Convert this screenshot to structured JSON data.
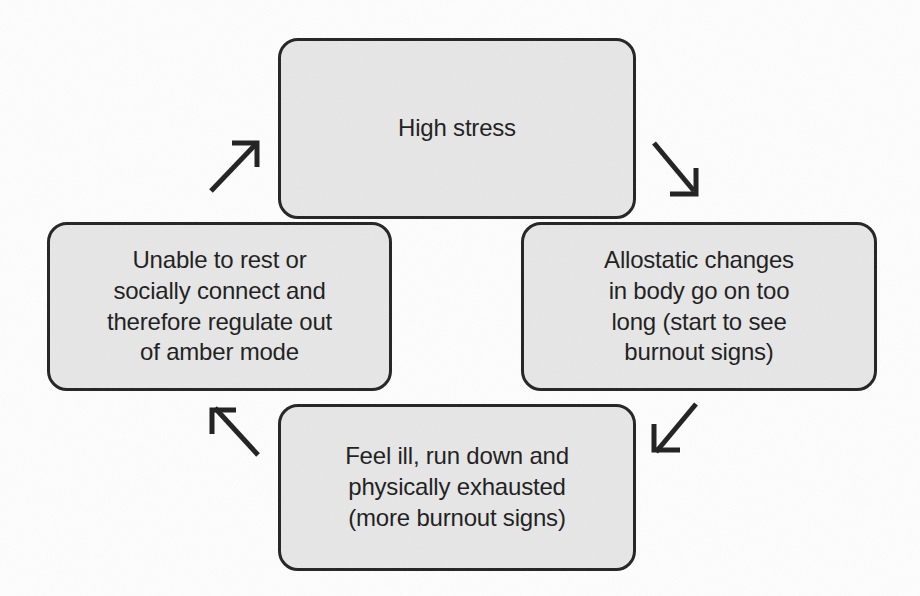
{
  "diagram": {
    "type": "cycle-flowchart",
    "direction": "clockwise",
    "canvas": {
      "width": 920,
      "height": 596,
      "background": "#fefefe"
    },
    "style": {
      "node_fill": "#e7e7e7",
      "node_border": "#222222",
      "text_color": "#1c1c1c",
      "arrow_color": "#1f1f1f"
    },
    "nodes": [
      {
        "id": "high-stress",
        "position": "top",
        "label": "High stress"
      },
      {
        "id": "allostatic-changes",
        "position": "right",
        "label": "Allostatic changes\nin body go on too\nlong (start to see\nburnout signs)"
      },
      {
        "id": "feel-ill",
        "position": "bottom",
        "label": "Feel ill, run down and\nphysically exhausted\n(more burnout signs)"
      },
      {
        "id": "unable-to-rest",
        "position": "left",
        "label": "Unable to rest or\nsocially connect and\ntherefore regulate out\nof amber mode"
      }
    ],
    "edges": [
      {
        "id": "edge-top-to-right",
        "from": "high-stress",
        "to": "allostatic-changes",
        "direction": "down-right"
      },
      {
        "id": "edge-right-to-bottom",
        "from": "allostatic-changes",
        "to": "feel-ill",
        "direction": "down-left"
      },
      {
        "id": "edge-bottom-to-left",
        "from": "feel-ill",
        "to": "unable-to-rest",
        "direction": "up-left"
      },
      {
        "id": "edge-left-to-top",
        "from": "unable-to-rest",
        "to": "high-stress",
        "direction": "up-right"
      }
    ]
  }
}
